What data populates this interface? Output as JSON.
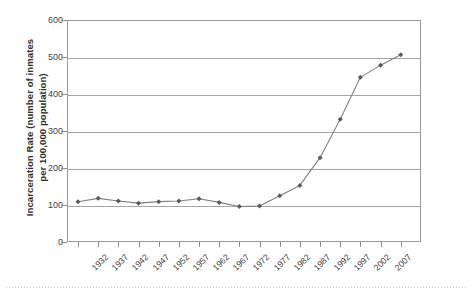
{
  "chart_data": {
    "type": "line",
    "title": "",
    "xlabel": "",
    "ylabel": "Incarceration Rate (number of inmates\nper 100,000 population)",
    "ylim": [
      0,
      600
    ],
    "ytick_step": 100,
    "yticks": [
      "0",
      "100",
      "200",
      "300",
      "400",
      "500",
      "600"
    ],
    "grid": true,
    "legend": false,
    "marker": "diamond",
    "line_color": "#808080",
    "marker_color": "#595959",
    "categories": [
      "1932",
      "1937",
      "1942",
      "1947",
      "1952",
      "1957",
      "1962",
      "1967",
      "1972",
      "1977",
      "1982",
      "1987",
      "1992",
      "1997",
      "2002",
      "2007"
    ],
    "values": [
      109,
      118,
      111,
      105,
      109,
      111,
      117,
      107,
      96,
      97,
      125,
      153,
      228,
      332,
      445,
      478
    ],
    "series": [
      {
        "name": "Incarceration Rate",
        "points": [
          {
            "x": "1932",
            "y": 109
          },
          {
            "x": "1937",
            "y": 118
          },
          {
            "x": "1942",
            "y": 111
          },
          {
            "x": "1947",
            "y": 105
          },
          {
            "x": "1952",
            "y": 109
          },
          {
            "x": "1957",
            "y": 111
          },
          {
            "x": "1962",
            "y": 117
          },
          {
            "x": "1967",
            "y": 107
          },
          {
            "x": "1972",
            "y": 96
          },
          {
            "x": "1977",
            "y": 97
          },
          {
            "x": "1982",
            "y": 125
          },
          {
            "x": "1987",
            "y": 153
          },
          {
            "x": "1992",
            "y": 228
          },
          {
            "x": "1997",
            "y": 332
          },
          {
            "x": "2002",
            "y": 445
          },
          {
            "x": "2007",
            "y": 478
          },
          {
            "x": "2012",
            "y": 506
          }
        ]
      }
    ],
    "extra_point_note": "final plotted point at ~506 beyond last labeled tick"
  }
}
